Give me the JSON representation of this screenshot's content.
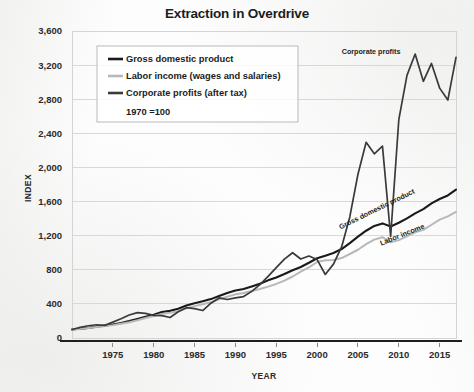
{
  "chart_data": {
    "type": "line",
    "title": "Extraction in Overdrive",
    "xlabel": "YEAR",
    "ylabel": "INDEX",
    "xlim": [
      1970,
      2017
    ],
    "ylim": [
      0,
      3600
    ],
    "grid": true,
    "legend_position": "upper-left",
    "legend_note": "1970 =100",
    "yticks": [
      "0",
      "400",
      "800",
      "1,200",
      "1,600",
      "2,000",
      "2,400",
      "2,800",
      "3,200",
      "3,600"
    ],
    "ytick_values": [
      0,
      400,
      800,
      1200,
      1600,
      2000,
      2400,
      2800,
      3200,
      3600
    ],
    "xticks": [
      "1975",
      "1980",
      "1985",
      "1990",
      "1995",
      "2000",
      "2005",
      "2010",
      "2015"
    ],
    "xtick_values": [
      1975,
      1980,
      1985,
      1990,
      1995,
      2000,
      2005,
      2010,
      2015
    ],
    "annotations": [
      {
        "text": "Corporate profits",
        "x": 2010.2,
        "y": 3330,
        "rotate": 0
      },
      {
        "text": "Gross domestic product",
        "x": 2012.0,
        "y": 1700,
        "rotate": -26
      },
      {
        "text": "Labor income",
        "x": 2013.2,
        "y": 1290,
        "rotate": -22
      }
    ],
    "x": [
      1970,
      1971,
      1972,
      1973,
      1974,
      1975,
      1976,
      1977,
      1978,
      1979,
      1980,
      1981,
      1982,
      1983,
      1984,
      1985,
      1986,
      1987,
      1988,
      1989,
      1990,
      1991,
      1992,
      1993,
      1994,
      1995,
      1996,
      1997,
      1998,
      1999,
      2000,
      2001,
      2002,
      2003,
      2004,
      2005,
      2006,
      2007,
      2008,
      2009,
      2010,
      2011,
      2012,
      2013,
      2014,
      2015,
      2016,
      2017
    ],
    "series": [
      {
        "name": "Gross domestic product",
        "color": "#1a1a1a",
        "width": 2.1,
        "values": [
          100,
          108,
          119,
          133,
          145,
          158,
          177,
          198,
          224,
          250,
          272,
          305,
          318,
          342,
          380,
          408,
          430,
          456,
          492,
          527,
          556,
          574,
          605,
          637,
          676,
          710,
          750,
          795,
          832,
          882,
          935,
          965,
          996,
          1043,
          1113,
          1188,
          1258,
          1314,
          1344,
          1308,
          1352,
          1402,
          1462,
          1512,
          1578,
          1630,
          1672,
          1740
        ]
      },
      {
        "name": "Labor income (wages and salaries)",
        "color": "#b8b8b8",
        "width": 2.0,
        "values": [
          100,
          107,
          117,
          129,
          141,
          151,
          167,
          185,
          208,
          234,
          258,
          283,
          296,
          314,
          347,
          374,
          396,
          421,
          454,
          483,
          512,
          527,
          551,
          574,
          602,
          634,
          672,
          721,
          779,
          829,
          891,
          912,
          914,
          937,
          985,
          1035,
          1100,
          1154,
          1182,
          1122,
          1148,
          1192,
          1240,
          1268,
          1328,
          1388,
          1426,
          1478
        ]
      },
      {
        "name": "Corporate profits (after tax)",
        "color": "#3a3a3a",
        "width": 1.7,
        "values": [
          100,
          124,
          144,
          155,
          148,
          186,
          226,
          269,
          298,
          289,
          265,
          262,
          240,
          307,
          356,
          345,
          322,
          408,
          470,
          451,
          470,
          486,
          547,
          625,
          722,
          826,
          925,
          1000,
          926,
          962,
          920,
          745,
          866,
          1068,
          1420,
          1920,
          2295,
          2160,
          2250,
          1190,
          2560,
          3080,
          3330,
          3010,
          3220,
          2930,
          2790,
          3290
        ]
      }
    ]
  },
  "legend": {
    "items": [
      {
        "label": "Gross domestic product",
        "color": "#1a1a1a"
      },
      {
        "label": "Labor income (wages and salaries)",
        "color": "#b8b8b8"
      },
      {
        "label": "Corporate profits (after tax)",
        "color": "#3a3a3a"
      }
    ],
    "note": "1970 =100"
  }
}
